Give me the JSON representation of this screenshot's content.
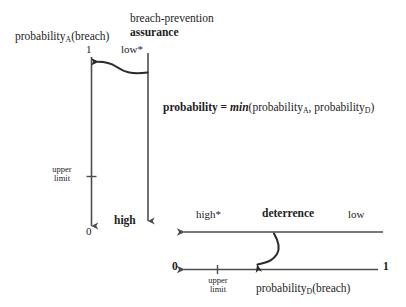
{
  "diagram": {
    "title_line1": "breach-prevention",
    "title_line2": "assurance",
    "axis_a_label_main": "probability",
    "axis_a_label_sub": "A",
    "axis_a_label_tail": "(breach)",
    "axis_a_top_value": "1",
    "axis_a_bottom_value": "0",
    "axis_a_upper_limit_line1": "upper",
    "axis_a_upper_limit_line2": "limit",
    "assurance_top_label": "low*",
    "assurance_bottom_label": "high",
    "formula_lead": "probability = ",
    "formula_min": "min",
    "formula_open": "(probability",
    "formula_sub_a": "A",
    "formula_mid": ", probability",
    "formula_sub_d": "D",
    "formula_close": ")",
    "deterrence_label": "deterrence",
    "deterrence_left_label": "high*",
    "deterrence_right_label": "low",
    "axis_d_left_value": "0",
    "axis_d_right_value": "1",
    "axis_d_upper_limit_line1": "upper",
    "axis_d_upper_limit_line2": "limit",
    "axis_d_label_main": "probability",
    "axis_d_label_sub": "D",
    "axis_d_label_tail": "(breach)",
    "colors": {
      "axis": "#4d4d4d",
      "arrow": "#2b2b2b",
      "text": "#1d1d1d",
      "background": "#ffffff"
    }
  }
}
